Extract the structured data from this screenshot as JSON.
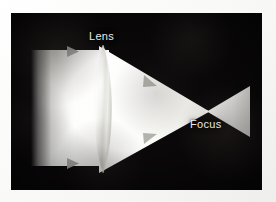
{
  "figure": {
    "labels": {
      "lens": "Lens",
      "focus": "Focus"
    },
    "colors": {
      "background": "#0a0809",
      "beam": "#fbfbf9",
      "label_text": "#e9e9e6",
      "arrow": "#9c9c98",
      "mount": "#f7f7f5"
    },
    "elements": [
      {
        "name": "incoming-parallel-beam",
        "kind": "beam",
        "direction": "rightward",
        "shape": "rectangular-slab"
      },
      {
        "name": "biconvex-lens",
        "kind": "lens",
        "type": "biconvex",
        "orientation": "vertical"
      },
      {
        "name": "converging-beam",
        "kind": "beam",
        "direction": "rightward",
        "shape": "triangle-converging"
      },
      {
        "name": "diverging-beam",
        "kind": "beam",
        "direction": "rightward",
        "shape": "triangle-diverging"
      },
      {
        "name": "focal-point",
        "kind": "point"
      }
    ],
    "arrows": [
      {
        "name": "arrow-incoming-top",
        "x": 68,
        "y": 51,
        "angle": 0
      },
      {
        "name": "arrow-incoming-bottom",
        "x": 68,
        "y": 163,
        "angle": 0
      },
      {
        "name": "arrow-converging-top",
        "x": 153,
        "y": 85,
        "angle": 22
      },
      {
        "name": "arrow-converging-bottom",
        "x": 153,
        "y": 130,
        "angle": -22
      }
    ]
  }
}
